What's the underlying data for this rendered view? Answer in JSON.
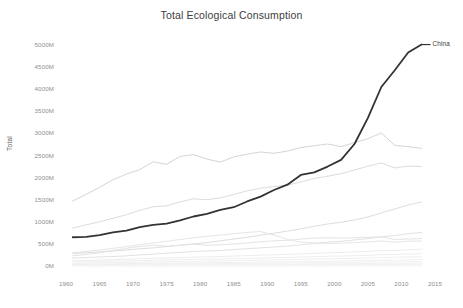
{
  "chart_data": {
    "type": "line",
    "title": "Total Ecological Consumption",
    "xlabel": "",
    "ylabel": "Total",
    "xlim": [
      1960,
      2015
    ],
    "ylim": [
      0,
      5000
    ],
    "grid": false,
    "legend_position": "line-end-label",
    "y_tick_labels": [
      "5000M",
      "4500M",
      "4000M",
      "3500M",
      "3000M",
      "2500M",
      "2000M",
      "1500M",
      "1000M",
      "500M",
      "0M"
    ],
    "y_tick_values": [
      5000,
      4500,
      4000,
      3500,
      3000,
      2500,
      2000,
      1500,
      1000,
      500,
      0
    ],
    "x_tick_labels": [
      "1960",
      "1965",
      "1970",
      "1975",
      "1980",
      "1985",
      "1990",
      "1995",
      "2000",
      "2005",
      "2010",
      "2015"
    ],
    "x_tick_values": [
      1960,
      1965,
      1970,
      1975,
      1980,
      1985,
      1990,
      1995,
      2000,
      2005,
      2010,
      2015
    ],
    "x": [
      1961,
      1963,
      1965,
      1967,
      1969,
      1971,
      1973,
      1975,
      1977,
      1979,
      1981,
      1983,
      1985,
      1987,
      1989,
      1991,
      1993,
      1995,
      1997,
      1999,
      2001,
      2003,
      2005,
      2007,
      2009,
      2011,
      2013
    ],
    "annotations": [
      {
        "text": "China",
        "x": 2013,
        "y": 5000,
        "series": "China"
      }
    ],
    "series": [
      {
        "name": "China",
        "highlight": true,
        "color": "#333333",
        "width": 1.8,
        "values": [
          650,
          660,
          700,
          760,
          800,
          880,
          930,
          960,
          1030,
          1120,
          1180,
          1270,
          1330,
          1460,
          1570,
          1720,
          1840,
          2060,
          2120,
          2250,
          2400,
          2760,
          3350,
          4050,
          4430,
          4830,
          5010
        ]
      },
      {
        "name": "United States",
        "highlight": false,
        "color": "#d5d5d5",
        "width": 1.0,
        "values": [
          1470,
          1620,
          1780,
          1950,
          2080,
          2180,
          2360,
          2300,
          2480,
          2520,
          2420,
          2350,
          2470,
          2530,
          2580,
          2550,
          2600,
          2680,
          2720,
          2760,
          2700,
          2790,
          2880,
          3010,
          2730,
          2700,
          2660
        ]
      },
      {
        "name": "Europe band",
        "highlight": false,
        "color": "#dcdcdc",
        "width": 1.0,
        "values": [
          860,
          930,
          1000,
          1080,
          1160,
          1260,
          1340,
          1360,
          1450,
          1520,
          1500,
          1540,
          1620,
          1700,
          1760,
          1800,
          1830,
          1900,
          1980,
          2030,
          2090,
          2170,
          2260,
          2330,
          2220,
          2260,
          2250
        ]
      },
      {
        "name": "India",
        "highlight": false,
        "color": "#dedede",
        "width": 1.0,
        "values": [
          280,
          300,
          320,
          340,
          360,
          390,
          410,
          440,
          470,
          500,
          530,
          570,
          610,
          650,
          700,
          740,
          790,
          840,
          900,
          950,
          990,
          1040,
          1110,
          1200,
          1290,
          1380,
          1450
        ]
      },
      {
        "name": "Brazil",
        "highlight": false,
        "color": "#e2e2e2",
        "width": 1.0,
        "values": [
          180,
          190,
          205,
          215,
          230,
          250,
          270,
          290,
          310,
          330,
          340,
          350,
          370,
          390,
          410,
          430,
          450,
          480,
          510,
          540,
          560,
          590,
          620,
          660,
          690,
          730,
          760
        ]
      },
      {
        "name": "Japan",
        "highlight": false,
        "color": "#e4e4e4",
        "width": 1.0,
        "values": [
          230,
          260,
          300,
          350,
          400,
          440,
          470,
          450,
          470,
          490,
          470,
          480,
          500,
          520,
          550,
          570,
          580,
          610,
          630,
          640,
          630,
          640,
          650,
          660,
          600,
          610,
          620
        ]
      },
      {
        "name": "Russia",
        "highlight": false,
        "color": "#e6e6e6",
        "width": 1.0,
        "values": [
          300,
          330,
          360,
          400,
          440,
          480,
          520,
          560,
          600,
          640,
          670,
          700,
          730,
          760,
          780,
          700,
          600,
          540,
          520,
          510,
          520,
          530,
          545,
          565,
          540,
          560,
          565
        ]
      },
      {
        "name": "other-1",
        "highlight": false,
        "color": "#eaeaea",
        "width": 0.9,
        "values": [
          120,
          125,
          135,
          145,
          155,
          165,
          175,
          180,
          190,
          200,
          205,
          215,
          225,
          235,
          245,
          255,
          262,
          275,
          288,
          298,
          305,
          318,
          332,
          348,
          352,
          368,
          378
        ]
      },
      {
        "name": "other-2",
        "highlight": false,
        "color": "#ececec",
        "width": 0.9,
        "values": [
          90,
          95,
          100,
          108,
          115,
          122,
          130,
          135,
          142,
          150,
          152,
          158,
          165,
          172,
          180,
          188,
          194,
          202,
          212,
          220,
          226,
          234,
          244,
          256,
          260,
          272,
          280
        ]
      },
      {
        "name": "other-3",
        "highlight": false,
        "color": "#ededed",
        "width": 0.9,
        "values": [
          60,
          64,
          68,
          74,
          80,
          86,
          92,
          96,
          102,
          108,
          110,
          115,
          120,
          126,
          132,
          138,
          143,
          150,
          157,
          163,
          168,
          175,
          183,
          192,
          196,
          205,
          212
        ]
      },
      {
        "name": "other-4",
        "highlight": false,
        "color": "#eeeeee",
        "width": 0.9,
        "values": [
          40,
          42,
          45,
          49,
          53,
          57,
          61,
          64,
          68,
          72,
          74,
          77,
          81,
          85,
          89,
          93,
          96,
          101,
          106,
          110,
          114,
          119,
          124,
          130,
          133,
          139,
          144
        ]
      },
      {
        "name": "other-5",
        "highlight": false,
        "color": "#efefef",
        "width": 0.9,
        "values": [
          28,
          30,
          32,
          34,
          37,
          40,
          43,
          45,
          48,
          51,
          52,
          54,
          57,
          60,
          63,
          66,
          68,
          71,
          75,
          78,
          80,
          84,
          88,
          92,
          94,
          98,
          102
        ]
      },
      {
        "name": "other-6",
        "highlight": false,
        "color": "#f0f0f0",
        "width": 0.9,
        "values": [
          18,
          19,
          20,
          22,
          24,
          26,
          28,
          29,
          31,
          33,
          34,
          35,
          37,
          39,
          41,
          43,
          44,
          46,
          49,
          51,
          52,
          55,
          57,
          60,
          61,
          64,
          66
        ]
      },
      {
        "name": "other-7",
        "highlight": false,
        "color": "#f1f1f1",
        "width": 0.9,
        "values": [
          12,
          12,
          13,
          14,
          15,
          17,
          18,
          19,
          20,
          21,
          22,
          23,
          24,
          25,
          26,
          27,
          28,
          30,
          31,
          33,
          34,
          35,
          37,
          38,
          39,
          41,
          43
        ]
      },
      {
        "name": "other-8",
        "highlight": false,
        "color": "#f2f2f2",
        "width": 0.9,
        "values": [
          8,
          8,
          9,
          9,
          10,
          11,
          12,
          12,
          13,
          14,
          14,
          15,
          16,
          16,
          17,
          18,
          18,
          19,
          20,
          21,
          22,
          23,
          24,
          25,
          25,
          27,
          28
        ]
      },
      {
        "name": "other-9",
        "highlight": false,
        "color": "#f3f3f3",
        "width": 0.9,
        "values": [
          5,
          5,
          6,
          6,
          6,
          7,
          7,
          8,
          8,
          9,
          9,
          9,
          10,
          10,
          11,
          11,
          12,
          12,
          13,
          13,
          14,
          14,
          15,
          16,
          16,
          17,
          18
        ]
      },
      {
        "name": "other-10",
        "highlight": false,
        "color": "#f4f4f4",
        "width": 0.9,
        "values": [
          3,
          3,
          3,
          4,
          4,
          4,
          4,
          5,
          5,
          5,
          5,
          6,
          6,
          6,
          7,
          7,
          7,
          8,
          8,
          8,
          9,
          9,
          9,
          10,
          10,
          11,
          11
        ]
      },
      {
        "name": "other-11",
        "highlight": false,
        "color": "#f5f5f5",
        "width": 0.9,
        "values": [
          2,
          2,
          2,
          2,
          2,
          3,
          3,
          3,
          3,
          3,
          3,
          4,
          4,
          4,
          4,
          4,
          5,
          5,
          5,
          5,
          5,
          6,
          6,
          6,
          6,
          7,
          7
        ]
      },
      {
        "name": "other-12",
        "highlight": false,
        "color": "#f6f6f6",
        "width": 0.9,
        "values": [
          1,
          1,
          1,
          1,
          1,
          1,
          2,
          2,
          2,
          2,
          2,
          2,
          2,
          2,
          2,
          3,
          3,
          3,
          3,
          3,
          3,
          3,
          4,
          4,
          4,
          4,
          4
        ]
      },
      {
        "name": "other-13",
        "highlight": false,
        "color": "#f7f7f7",
        "width": 0.9,
        "values": [
          1,
          1,
          1,
          1,
          1,
          1,
          1,
          1,
          1,
          1,
          1,
          1,
          1,
          1,
          1,
          1,
          1,
          2,
          2,
          2,
          2,
          2,
          2,
          2,
          2,
          2,
          2
        ]
      }
    ]
  },
  "layout": {
    "plot_left": 66,
    "plot_right": 435,
    "plot_top": 45,
    "plot_bottom": 266
  }
}
